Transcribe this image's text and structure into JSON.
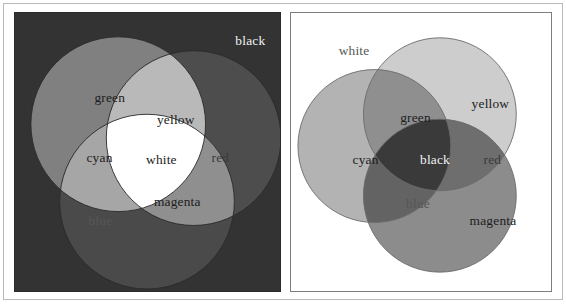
{
  "figure": {
    "panel_count": 2,
    "rendering": "grayscale"
  },
  "colors": {
    "page_background": "#ffffff",
    "outer_frame": "#b9b9b9",
    "additive_background": "#333333",
    "subtractive_background": "#ffffff",
    "stroke": "#2a2a2a",
    "label_dark": "#1c1c1c",
    "label_light": "#f2f2f2"
  },
  "additive_panel": {
    "name": "additive-rgb-venn",
    "background_label": "black",
    "background_fill": "#333333",
    "circles": [
      {
        "id": "green",
        "label": "green",
        "cx": 104,
        "cy": 112,
        "r": 88,
        "fill": "#808080"
      },
      {
        "id": "red",
        "label": "red",
        "cx": 180,
        "cy": 126,
        "r": 88,
        "fill": "#4d4d4d"
      },
      {
        "id": "blue",
        "label": "blue",
        "cx": 133,
        "cy": 190,
        "r": 88,
        "fill": "#4a4a4a"
      }
    ],
    "overlaps": [
      {
        "id": "yellow",
        "label": "yellow",
        "of": [
          "green",
          "red"
        ],
        "fill": "#b9b9b9"
      },
      {
        "id": "cyan",
        "label": "cyan",
        "of": [
          "green",
          "blue"
        ],
        "fill": "#a6a6a6"
      },
      {
        "id": "magenta",
        "label": "magenta",
        "of": [
          "red",
          "blue"
        ],
        "fill": "#8f8f8f"
      },
      {
        "id": "white",
        "label": "white",
        "of": [
          "green",
          "red",
          "blue"
        ],
        "fill": "#ffffff"
      }
    ],
    "labels": [
      {
        "text": "black",
        "x": 222,
        "y": 32,
        "style": "light"
      },
      {
        "text": "green",
        "x": 80,
        "y": 90,
        "style": "dark"
      },
      {
        "text": "yellow",
        "x": 143,
        "y": 112,
        "style": "dark"
      },
      {
        "text": "cyan",
        "x": 72,
        "y": 150,
        "style": "dark"
      },
      {
        "text": "white",
        "x": 132,
        "y": 152,
        "style": "dark"
      },
      {
        "text": "red",
        "x": 198,
        "y": 150,
        "style": "dim"
      },
      {
        "text": "magenta",
        "x": 140,
        "y": 194,
        "style": "dark"
      },
      {
        "text": "blue",
        "x": 74,
        "y": 214,
        "style": "faint"
      }
    ]
  },
  "subtractive_panel": {
    "name": "subtractive-cmy-venn",
    "background_label": "white",
    "background_fill": "#ffffff",
    "circles": [
      {
        "id": "cyan",
        "label": "cyan",
        "cx": 84,
        "cy": 134,
        "r": 77,
        "fill": "#b3b3b3"
      },
      {
        "id": "yellow",
        "label": "yellow",
        "cx": 150,
        "cy": 102,
        "r": 77,
        "fill": "#cdcdcd"
      },
      {
        "id": "magenta",
        "label": "magenta",
        "cx": 150,
        "cy": 184,
        "r": 77,
        "fill": "#8c8c8c"
      }
    ],
    "overlaps": [
      {
        "id": "green",
        "label": "green",
        "of": [
          "cyan",
          "yellow"
        ],
        "fill": "#8f8f8f"
      },
      {
        "id": "blue",
        "label": "blue",
        "of": [
          "cyan",
          "magenta"
        ],
        "fill": "#636363"
      },
      {
        "id": "red",
        "label": "red",
        "of": [
          "yellow",
          "magenta"
        ],
        "fill": "#6e6e6e"
      },
      {
        "id": "black",
        "label": "black",
        "of": [
          "cyan",
          "yellow",
          "magenta"
        ],
        "fill": "#3a3a3a"
      }
    ],
    "labels": [
      {
        "text": "white",
        "x": 48,
        "y": 42,
        "style": "faint"
      },
      {
        "text": "yellow",
        "x": 182,
        "y": 96,
        "style": "dark"
      },
      {
        "text": "green",
        "x": 110,
        "y": 110,
        "style": "dark"
      },
      {
        "text": "cyan",
        "x": 62,
        "y": 152,
        "style": "dark"
      },
      {
        "text": "black",
        "x": 130,
        "y": 152,
        "style": "light"
      },
      {
        "text": "red",
        "x": 194,
        "y": 152,
        "style": "dim"
      },
      {
        "text": "blue",
        "x": 116,
        "y": 196,
        "style": "faint"
      },
      {
        "text": "magenta",
        "x": 180,
        "y": 214,
        "style": "dark"
      }
    ]
  }
}
